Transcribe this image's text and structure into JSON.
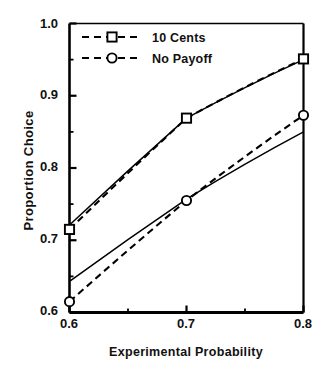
{
  "chart_data": {
    "type": "line",
    "title": "",
    "xlabel": "Experimental Probability",
    "ylabel": "Proportion Choice",
    "xlim": [
      0.6,
      0.8
    ],
    "ylim": [
      0.6,
      1.0
    ],
    "xticks": [
      "0.6",
      "0.7",
      "0.8"
    ],
    "xtick_values": [
      0.6,
      0.7,
      0.8
    ],
    "yticks": [
      "0.6",
      "0.7",
      "0.8",
      "0.9",
      "1.0"
    ],
    "ytick_values": [
      0.6,
      0.7,
      0.8,
      0.9,
      1.0
    ],
    "minor_ytick_values": [
      0.65,
      0.75,
      0.85,
      0.95
    ],
    "minor_xtick_values": [
      0.65,
      0.75
    ],
    "grid": false,
    "legend_position": "top-left",
    "x": [
      0.6,
      0.7,
      0.8
    ],
    "series": [
      {
        "name": "10 Cents",
        "style": "dashed",
        "marker": "square-open",
        "values": [
          0.715,
          0.869,
          0.951
        ]
      },
      {
        "name": "No Payoff",
        "style": "dashed",
        "marker": "circle-open",
        "values": [
          0.615,
          0.755,
          0.873
        ]
      },
      {
        "name": "10 Cents predicted",
        "style": "solid",
        "marker": "none",
        "values": [
          0.721,
          0.869,
          0.95
        ]
      },
      {
        "name": "No Payoff predicted",
        "style": "solid",
        "marker": "none",
        "values": [
          0.643,
          0.757,
          0.85
        ]
      }
    ]
  },
  "legend": {
    "items": [
      {
        "label": "10 Cents",
        "marker": "square-open",
        "style": "dashed"
      },
      {
        "label": "No Payoff",
        "marker": "circle-open",
        "style": "dashed"
      }
    ]
  },
  "axis_labels": {
    "x": "Experimental Probability",
    "y": "Proportion Choice"
  },
  "colors": {
    "line": "#000000",
    "axis": "#000000",
    "background": "#ffffff"
  }
}
